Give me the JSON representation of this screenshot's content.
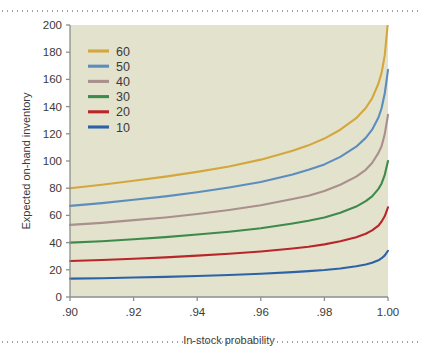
{
  "figure": {
    "name": "expected-on-hand-inventory-chart",
    "background": "#ffffff",
    "plot_background": "#e3e2cd",
    "axis_color": "#8a8f8c",
    "text_color": "#3a3a3a"
  },
  "chart_data": {
    "type": "line",
    "title": "",
    "subtitle": "",
    "xlabel": "In-stock probability",
    "ylabel": "Expected on-hand inventory",
    "xlim": [
      0.9,
      1.0
    ],
    "ylim": [
      0,
      200
    ],
    "xticks": [
      0.9,
      0.92,
      0.94,
      0.96,
      0.98,
      1.0
    ],
    "xticklabels": [
      ".90",
      ".92",
      ".94",
      ".96",
      ".98",
      "1.00"
    ],
    "yticks": [
      0,
      20,
      40,
      60,
      80,
      100,
      120,
      140,
      160,
      180,
      200
    ],
    "yticklabels": [
      "0",
      "20",
      "40",
      "60",
      "80",
      "100",
      "120",
      "140",
      "160",
      "180",
      "200"
    ],
    "grid": false,
    "legend_position": "upper left",
    "legend_title": "",
    "x": [
      0.9,
      0.91,
      0.92,
      0.93,
      0.94,
      0.95,
      0.96,
      0.97,
      0.975,
      0.98,
      0.985,
      0.99,
      0.993,
      0.995,
      0.997,
      0.998,
      0.999,
      1.0
    ],
    "series": [
      {
        "name": "60",
        "label": "60",
        "color": "#d4a73c",
        "values": [
          80,
          82.5,
          85.5,
          88.5,
          92,
          96,
          101,
          107.5,
          111.5,
          116.5,
          123,
          131.5,
          139,
          146,
          157,
          165,
          178,
          203
        ]
      },
      {
        "name": "50",
        "label": "50",
        "color": "#5b8dbe",
        "values": [
          67,
          69,
          71.5,
          74,
          77,
          80.5,
          84.5,
          90,
          93.5,
          97.5,
          103,
          110.5,
          117,
          123,
          132,
          139,
          150,
          167
        ]
      },
      {
        "name": "40",
        "label": "40",
        "color": "#a98f8d",
        "values": [
          53,
          54.5,
          56.5,
          58.5,
          61,
          64,
          67.5,
          72,
          74.5,
          78,
          82.5,
          88.5,
          93.5,
          98.5,
          106,
          111,
          120,
          134
        ]
      },
      {
        "name": "30",
        "label": "30",
        "color": "#3d8b4a",
        "values": [
          40,
          41,
          42.5,
          44,
          46,
          48,
          50.5,
          54,
          56,
          58.5,
          62,
          66.5,
          70.5,
          74,
          79.5,
          83.5,
          90,
          100
        ]
      },
      {
        "name": "20",
        "label": "20",
        "color": "#b8262a",
        "values": [
          26.5,
          27.2,
          28.1,
          29.1,
          30.4,
          31.8,
          33.5,
          35.7,
          37,
          38.7,
          41,
          44,
          46.5,
          49,
          52.5,
          55.5,
          59.5,
          66
        ]
      },
      {
        "name": "10",
        "label": "10",
        "color": "#2c62a8",
        "values": [
          13.5,
          13.8,
          14.3,
          14.8,
          15.4,
          16.2,
          17.1,
          18.3,
          19,
          19.8,
          21,
          22.6,
          23.9,
          25.2,
          27,
          28.5,
          30.6,
          34
        ]
      }
    ]
  }
}
